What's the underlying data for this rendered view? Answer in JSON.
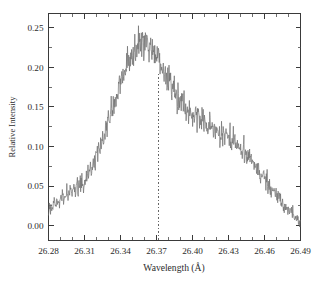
{
  "figure": {
    "background_color": "#ffffff",
    "frame_color": "#3a3a3a",
    "trace_color": "#6f6f6f",
    "marker_color": "#555555"
  },
  "chart_data": {
    "type": "line",
    "title": "",
    "subtitle": "",
    "xlabel": "Wavelength (Å)",
    "ylabel": "Relative Intensity",
    "xlim": [
      26.28,
      26.49
    ],
    "ylim": [
      -0.018,
      0.268
    ],
    "grid": false,
    "legend": null,
    "legend_position": "none",
    "x_ticks": [
      26.28,
      26.31,
      26.34,
      26.37,
      26.4,
      26.43,
      26.46,
      26.49
    ],
    "x_tick_labels": [
      "26.28",
      "26.31",
      "26.34",
      "26.37",
      "26.40",
      "26.43",
      "26.46",
      "26.49"
    ],
    "x_minor_step": 0.01,
    "y_ticks": [
      0.0,
      0.05,
      0.1,
      0.15,
      0.2,
      0.25
    ],
    "y_tick_labels": [
      "0.00",
      "0.05",
      "0.10",
      "0.15",
      "0.20",
      "0.25"
    ],
    "y_minor_step": 0.025,
    "annotations": [
      {
        "name": "peak-center-marker",
        "type": "vline",
        "x": 26.372,
        "y_top": 0.192,
        "y_bottom": -0.018,
        "style": "dashed",
        "label": ""
      }
    ],
    "series": [
      {
        "name": "spectrum",
        "style": "noisy-line",
        "noise_amplitude": 0.0075,
        "x": [
          26.28,
          26.283,
          26.286,
          26.289,
          26.292,
          26.295,
          26.298,
          26.301,
          26.304,
          26.307,
          26.31,
          26.313,
          26.316,
          26.319,
          26.322,
          26.325,
          26.328,
          26.331,
          26.334,
          26.337,
          26.34,
          26.343,
          26.346,
          26.349,
          26.352,
          26.355,
          26.358,
          26.361,
          26.364,
          26.367,
          26.37,
          26.373,
          26.376,
          26.379,
          26.382,
          26.385,
          26.388,
          26.391,
          26.394,
          26.397,
          26.4,
          26.403,
          26.406,
          26.409,
          26.412,
          26.415,
          26.418,
          26.421,
          26.424,
          26.427,
          26.43,
          26.433,
          26.436,
          26.439,
          26.442,
          26.445,
          26.448,
          26.451,
          26.454,
          26.457,
          26.46,
          26.463,
          26.466,
          26.469,
          26.472,
          26.475,
          26.478,
          26.481,
          26.484,
          26.487,
          26.49
        ],
        "y": [
          0.024,
          0.022,
          0.026,
          0.03,
          0.034,
          0.038,
          0.042,
          0.045,
          0.048,
          0.051,
          0.055,
          0.062,
          0.072,
          0.083,
          0.095,
          0.108,
          0.122,
          0.137,
          0.152,
          0.168,
          0.183,
          0.196,
          0.207,
          0.216,
          0.222,
          0.227,
          0.229,
          0.228,
          0.225,
          0.221,
          0.214,
          0.205,
          0.196,
          0.186,
          0.177,
          0.17,
          0.163,
          0.157,
          0.151,
          0.146,
          0.142,
          0.139,
          0.136,
          0.133,
          0.131,
          0.128,
          0.125,
          0.122,
          0.119,
          0.116,
          0.112,
          0.108,
          0.104,
          0.1,
          0.096,
          0.091,
          0.085,
          0.079,
          0.073,
          0.067,
          0.06,
          0.054,
          0.048,
          0.042,
          0.036,
          0.03,
          0.024,
          0.018,
          0.012,
          0.008,
          0.004
        ]
      }
    ]
  }
}
